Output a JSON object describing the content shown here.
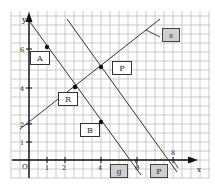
{
  "axes": {
    "x_label": "x",
    "y_label": "y",
    "origin_label": "O",
    "x_ticks": [
      "1",
      "2",
      "4",
      "6",
      "8"
    ],
    "y_ticks": [
      "1",
      "2",
      "4",
      "6"
    ]
  },
  "boxes": {
    "A": "A",
    "B": "B",
    "R": "R",
    "P_upper": "P",
    "s": "s",
    "g": "g",
    "P_lower": "P"
  },
  "colors": {
    "grid": "#b8b8b8",
    "line": "#333333",
    "box_fill_grey": "#cfcfcf"
  }
}
